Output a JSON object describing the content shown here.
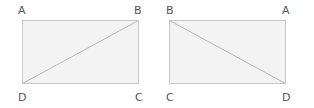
{
  "diagrams": [
    {
      "name": "left-rectangle",
      "rect": {
        "x1": 22,
        "y1": 20,
        "x2": 138,
        "y2": 83
      },
      "diagonal": {
        "from": "D",
        "to": "B"
      },
      "labels": [
        {
          "text": "A",
          "x": 18,
          "y": 14
        },
        {
          "text": "B",
          "x": 134,
          "y": 14
        },
        {
          "text": "D",
          "x": 18,
          "y": 101
        },
        {
          "text": "C",
          "x": 135,
          "y": 101
        }
      ]
    },
    {
      "name": "right-rectangle",
      "rect": {
        "x1": 169,
        "y1": 20,
        "x2": 285,
        "y2": 83
      },
      "diagonal": {
        "from": "B",
        "to": "D"
      },
      "labels": [
        {
          "text": "B",
          "x": 166,
          "y": 14
        },
        {
          "text": "A",
          "x": 282,
          "y": 14
        },
        {
          "text": "C",
          "x": 166,
          "y": 101
        },
        {
          "text": "D",
          "x": 282,
          "y": 101
        }
      ]
    }
  ],
  "colors": {
    "fill": "#f3f3f3",
    "stroke": "#c8c8c8",
    "label": "#555555"
  }
}
